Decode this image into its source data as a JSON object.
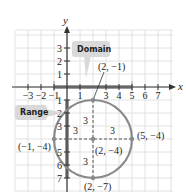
{
  "figure": {
    "x_axis_label": "x",
    "y_axis_label": "y",
    "x_ticks": [
      {
        "value": -3,
        "label": "−3"
      },
      {
        "value": -2,
        "label": "−2"
      },
      {
        "value": -1,
        "label": "−1"
      },
      {
        "value": 1,
        "label": "1"
      },
      {
        "value": 3,
        "label": "3"
      },
      {
        "value": 4,
        "label": "4"
      },
      {
        "value": 5,
        "label": "5"
      },
      {
        "value": 6,
        "label": "6"
      },
      {
        "value": 7,
        "label": "7"
      }
    ],
    "y_ticks": [
      {
        "value": 3,
        "label": "3"
      },
      {
        "value": 2,
        "label": "2"
      },
      {
        "value": 1,
        "label": "1"
      },
      {
        "value": -1,
        "label": "1"
      },
      {
        "value": -2,
        "label": "2"
      },
      {
        "value": -3,
        "label": "3"
      },
      {
        "value": -5,
        "label": "5"
      },
      {
        "value": -6,
        "label": "6"
      },
      {
        "value": -7,
        "label": "7"
      }
    ],
    "circle": {
      "center": [
        2,
        -4
      ],
      "radius": 3
    },
    "points": [
      {
        "x": 2,
        "y": -1,
        "label": "(2, −1)"
      },
      {
        "x": -1,
        "y": -4,
        "label": "(−1, −4)"
      },
      {
        "x": 2,
        "y": -4,
        "label": "(2, −4)"
      },
      {
        "x": 5,
        "y": -4,
        "label": "(5, −4)"
      },
      {
        "x": 2,
        "y": -7,
        "label": "(2, −7)"
      }
    ],
    "radius_labels": [
      "3",
      "3",
      "3",
      "3"
    ],
    "domain": {
      "label": "Domain",
      "interval": [
        -1,
        5
      ]
    },
    "range": {
      "label": "Range",
      "interval": [
        -7,
        -1
      ]
    },
    "colors": {
      "circle": "#8a8a8a",
      "grid": "#e2e2e2",
      "axis": "#333333",
      "callout_bg": "#d9d9d9",
      "highlight": "#9a9a9a"
    }
  }
}
